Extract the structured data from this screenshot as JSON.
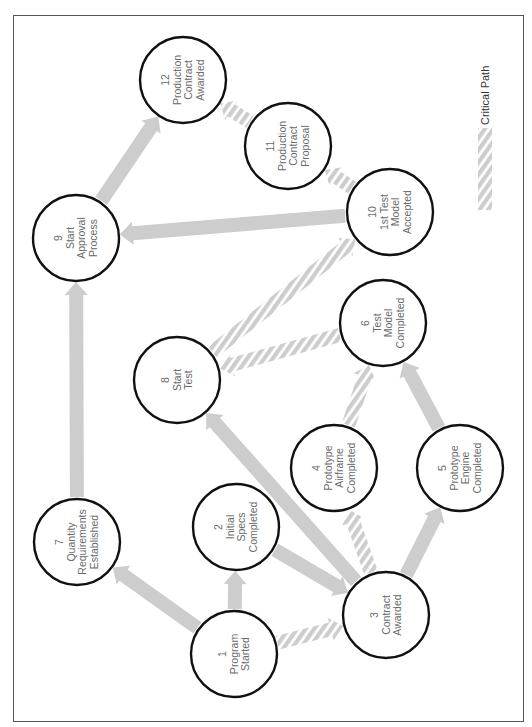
{
  "diagram": {
    "orientation": "rotated -90deg (text reads bottom to top)",
    "colors": {
      "arrow": "#cdcdcd",
      "node_stroke": "#111111",
      "node_text": "#6a6a6a",
      "frame": "#555555"
    },
    "legend": {
      "label": "Critical Path",
      "swatch": "hatched-arrow"
    },
    "nodes": [
      {
        "id": "1",
        "number": "1",
        "lines": [
          "Program",
          "Started"
        ],
        "cx": 234,
        "cy": 654
      },
      {
        "id": "2",
        "number": "2",
        "lines": [
          "Initial",
          "Specs",
          "Completed"
        ],
        "cx": 236,
        "cy": 527
      },
      {
        "id": "3",
        "number": "3",
        "lines": [
          "Contract",
          "Awarded"
        ],
        "cx": 386,
        "cy": 615
      },
      {
        "id": "4",
        "number": "4",
        "lines": [
          "Prototype",
          "Airframe",
          "Completed"
        ],
        "cx": 334,
        "cy": 468
      },
      {
        "id": "5",
        "number": "5",
        "lines": [
          "Prototype",
          "Engine",
          "Completed"
        ],
        "cx": 460,
        "cy": 468
      },
      {
        "id": "6",
        "number": "6",
        "lines": [
          "Test",
          "Model",
          "Completed"
        ],
        "cx": 383,
        "cy": 323
      },
      {
        "id": "7",
        "number": "7",
        "lines": [
          "Quantity",
          "Requirements",
          "Established"
        ],
        "cx": 77,
        "cy": 542
      },
      {
        "id": "8",
        "number": "8",
        "lines": [
          "Start",
          "Test"
        ],
        "cx": 177,
        "cy": 380
      },
      {
        "id": "9",
        "number": "9",
        "lines": [
          "Start",
          "Approval",
          "Process"
        ],
        "cx": 76,
        "cy": 238
      },
      {
        "id": "10",
        "number": "10",
        "lines": [
          "1st Test",
          "Model",
          "Accepted"
        ],
        "cx": 390,
        "cy": 212
      },
      {
        "id": "11",
        "number": "11",
        "lines": [
          "Production",
          "Contract",
          "Proposal"
        ],
        "cx": 288,
        "cy": 146
      },
      {
        "id": "12",
        "number": "12",
        "lines": [
          "Production",
          "Contract",
          "Awarded"
        ],
        "cx": 183,
        "cy": 80
      }
    ],
    "edges": [
      {
        "from": "1",
        "to": "7",
        "critical": false
      },
      {
        "from": "1",
        "to": "2",
        "critical": false
      },
      {
        "from": "1",
        "to": "3",
        "critical": true
      },
      {
        "from": "2",
        "to": "3",
        "critical": false
      },
      {
        "from": "3",
        "to": "8",
        "critical": false
      },
      {
        "from": "3",
        "to": "4",
        "critical": true
      },
      {
        "from": "3",
        "to": "5",
        "critical": false
      },
      {
        "from": "4",
        "to": "6",
        "critical": true
      },
      {
        "from": "5",
        "to": "6",
        "critical": false
      },
      {
        "from": "6",
        "to": "8",
        "critical": true
      },
      {
        "from": "8",
        "to": "10",
        "critical": true
      },
      {
        "from": "7",
        "to": "9",
        "critical": false
      },
      {
        "from": "10",
        "to": "9",
        "critical": false
      },
      {
        "from": "10",
        "to": "11",
        "critical": true
      },
      {
        "from": "11",
        "to": "12",
        "critical": true
      },
      {
        "from": "9",
        "to": "12",
        "critical": false
      }
    ]
  }
}
